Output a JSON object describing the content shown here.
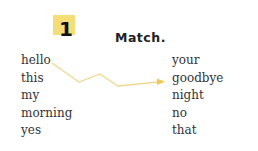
{
  "exercise": {
    "number": "1",
    "title": "Match.",
    "left_words": [
      "hello",
      "this",
      "my",
      "morning",
      "yes"
    ],
    "right_words": [
      "your",
      "goodbye",
      "night",
      "no",
      "that"
    ],
    "accent_color": "#f5dd78",
    "line_color": "#f0d890",
    "example_match": {
      "from": "hello",
      "to": "goodbye"
    }
  }
}
